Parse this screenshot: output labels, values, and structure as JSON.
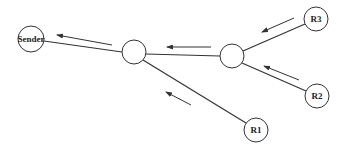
{
  "diagram": {
    "type": "multicast-tree",
    "nodes": [
      {
        "id": "sender",
        "label": "Sender",
        "cx": 31,
        "cy": 39,
        "r": 13
      },
      {
        "id": "routerA",
        "label": "",
        "cx": 134,
        "cy": 52,
        "r": 12
      },
      {
        "id": "routerB",
        "label": "",
        "cx": 232,
        "cy": 56,
        "r": 12
      },
      {
        "id": "r3",
        "label": "R3",
        "cx": 316,
        "cy": 19,
        "r": 12
      },
      {
        "id": "r2",
        "label": "R2",
        "cx": 317,
        "cy": 96,
        "r": 12
      },
      {
        "id": "r1",
        "label": "R1",
        "cx": 256,
        "cy": 130,
        "r": 12
      }
    ],
    "edges": [
      {
        "from": "routerA",
        "to": "sender"
      },
      {
        "from": "routerB",
        "to": "routerA"
      },
      {
        "from": "r3",
        "to": "routerB"
      },
      {
        "from": "r2",
        "to": "routerB"
      },
      {
        "from": "r1",
        "to": "routerA"
      }
    ],
    "arrows": [
      {
        "name": "arrow-a-to-sender",
        "x1": 112,
        "y1": 45,
        "x2": 57,
        "y2": 35
      },
      {
        "name": "arrow-b-to-a",
        "x1": 211,
        "y1": 47,
        "x2": 167,
        "y2": 47
      },
      {
        "name": "arrow-r3-to-b",
        "x1": 294,
        "y1": 18,
        "x2": 262,
        "y2": 32
      },
      {
        "name": "arrow-r2-to-b",
        "x1": 299,
        "y1": 80,
        "x2": 264,
        "y2": 66
      },
      {
        "name": "arrow-r1-to-a",
        "x1": 191,
        "y1": 105,
        "x2": 166,
        "y2": 92
      }
    ],
    "labels": {
      "sender": "Sender",
      "r1": "R1",
      "r2": "R2",
      "r3": "R3"
    }
  }
}
